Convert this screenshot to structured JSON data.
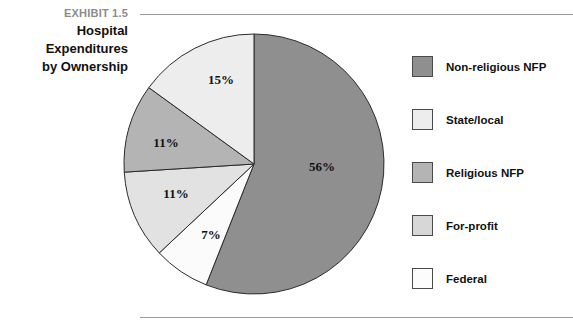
{
  "exhibit": {
    "kicker": "EXHIBIT 1.5",
    "title_line1": "Hospital",
    "title_line2": "Expenditures",
    "title_line3": "by Ownership"
  },
  "chart_data": {
    "type": "pie",
    "title": "Hospital Expenditures by Ownership",
    "xlabel": "",
    "ylabel": "",
    "units": "percent",
    "legend_position": "right",
    "start_angle_deg": 0,
    "direction": "clockwise",
    "categories": [
      "Non-religious NFP",
      "Federal",
      "For-profit",
      "Religious NFP",
      "State/local"
    ],
    "values": [
      56,
      7,
      11,
      11,
      15
    ],
    "labels": [
      "56%",
      "7%",
      "11%",
      "11%",
      "15%"
    ],
    "colors": [
      "#8f8f8f",
      "#fbfbfb",
      "#e2e2e2",
      "#b4b4b4",
      "#ededed"
    ],
    "slices": [
      {
        "name": "Non-religious NFP",
        "value": 56,
        "label": "56%",
        "color": "#8f8f8f",
        "label_x": 322,
        "label_y": 171
      },
      {
        "name": "Federal",
        "value": 7,
        "label": "7%",
        "color": "#fbfbfb",
        "label_x": 211,
        "label_y": 239
      },
      {
        "name": "For-profit",
        "value": 11,
        "label": "11%",
        "color": "#e2e2e2",
        "label_x": 176,
        "label_y": 198
      },
      {
        "name": "Religious NFP",
        "value": 11,
        "label": "11%",
        "color": "#b4b4b4",
        "label_x": 166,
        "label_y": 147
      },
      {
        "name": "State/local",
        "value": 15,
        "label": "15%",
        "color": "#ededed",
        "label_x": 221,
        "label_y": 84
      }
    ]
  },
  "legend": {
    "items": [
      {
        "label": "Non-religious NFP",
        "color": "#8f8f8f"
      },
      {
        "label": "State/local",
        "color": "#ededed"
      },
      {
        "label": "Religious NFP",
        "color": "#b4b4b4"
      },
      {
        "label": "For-profit",
        "color": "#d7d7d7"
      },
      {
        "label": "Federal",
        "color": "#fcfcfc"
      }
    ]
  }
}
